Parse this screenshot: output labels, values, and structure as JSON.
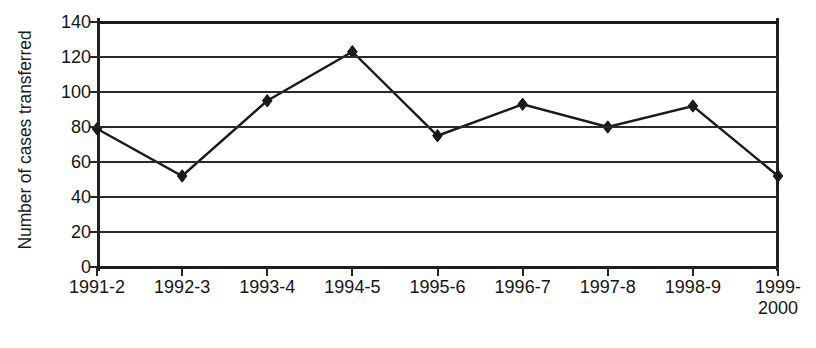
{
  "chart_data": {
    "type": "line",
    "title": "",
    "subtitle": "",
    "xlabel": "",
    "ylabel": "Number of cases transferred",
    "categories": [
      "1991-2",
      "1992-3",
      "1993-4",
      "1994-5",
      "1995-6",
      "1996-7",
      "1997-8",
      "1998-9",
      "1999-\n2000"
    ],
    "values": [
      79,
      52,
      95,
      123,
      75,
      93,
      80,
      92,
      52
    ],
    "series": [
      {
        "name": "Number of cases transferred",
        "values": [
          79,
          52,
          95,
          123,
          75,
          93,
          80,
          92,
          52
        ]
      }
    ],
    "ylim": [
      0,
      140
    ],
    "y_ticks": [
      0,
      20,
      40,
      60,
      80,
      100,
      120,
      140
    ],
    "y_tick_labels": [
      "0",
      "20",
      "40",
      "60",
      "80",
      "100",
      "120",
      "140"
    ],
    "grid": "horizontal",
    "legend": "none",
    "marker": "diamond",
    "marker_color": "#1a1a1a",
    "line_color": "#1a1a1a",
    "axis_color": "#222222",
    "background": "#ffffff"
  }
}
